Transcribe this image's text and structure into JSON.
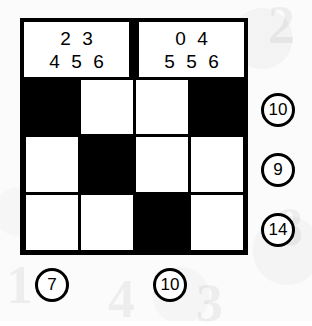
{
  "puzzle": {
    "type": "kakuro-style-grid",
    "grid": {
      "columns": 4,
      "rows": 3,
      "cells": [
        [
          {
            "state": "black",
            "value": ""
          },
          {
            "state": "white",
            "value": ""
          },
          {
            "state": "white",
            "value": ""
          },
          {
            "state": "black",
            "value": ""
          }
        ],
        [
          {
            "state": "white",
            "value": ""
          },
          {
            "state": "black",
            "value": ""
          },
          {
            "state": "white",
            "value": ""
          },
          {
            "state": "white",
            "value": ""
          }
        ],
        [
          {
            "state": "white",
            "value": ""
          },
          {
            "state": "white",
            "value": ""
          },
          {
            "state": "black",
            "value": ""
          },
          {
            "state": "white",
            "value": ""
          }
        ]
      ]
    },
    "clue_boxes": [
      {
        "position": "left",
        "top_line": [
          "2",
          "3"
        ],
        "bottom_line": [
          "4",
          "5",
          "6"
        ]
      },
      {
        "position": "right",
        "top_line": [
          "0",
          "4"
        ],
        "bottom_line": [
          "5",
          "5",
          "6"
        ]
      }
    ],
    "row_clues": [
      {
        "row": 1,
        "value": "10"
      },
      {
        "row": 2,
        "value": "9"
      },
      {
        "row": 3,
        "value": "14"
      }
    ],
    "column_clues": [
      {
        "column": 1,
        "value": "7"
      },
      {
        "column": 3,
        "value": "10"
      }
    ],
    "ghost_marks": [
      {
        "text": "2",
        "left": 268,
        "top": -6
      },
      {
        "text": "8",
        "left": 276,
        "top": 196
      },
      {
        "text": "3",
        "left": 196,
        "top": 272
      },
      {
        "text": "4",
        "left": 108,
        "top": 268
      },
      {
        "text": "1",
        "left": 6,
        "top": 254
      }
    ],
    "colors": {
      "ink": "#000000",
      "paper": "#fbfbfb",
      "cell_white": "#ffffff",
      "cell_black": "#000000"
    }
  }
}
